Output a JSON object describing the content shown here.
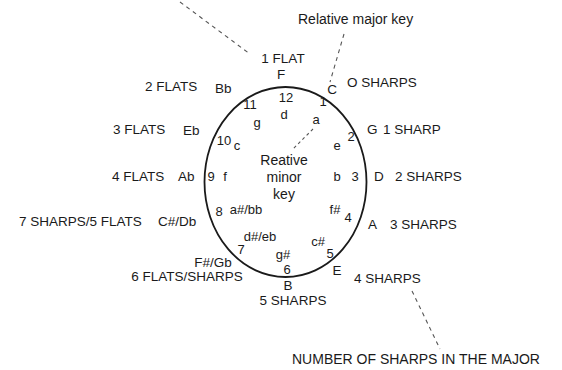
{
  "diagram": {
    "annotations": {
      "relative_major": "Relative major key",
      "relative_minor_line1": "Reative",
      "relative_minor_line2": "minor",
      "relative_minor_line3": "key",
      "number_of_sharps": "NUMBER OF SHARPS IN THE MAJOR"
    },
    "positions": [
      {
        "number": "12",
        "major": "F",
        "minor": "d",
        "signature": "1 FLAT"
      },
      {
        "number": "1",
        "major": "C",
        "minor": "a",
        "signature": "O SHARPS"
      },
      {
        "number": "2",
        "major": "G",
        "minor": "e",
        "signature": "1 SHARP"
      },
      {
        "number": "3",
        "major": "D",
        "minor": "b",
        "signature": "2 SHARPS"
      },
      {
        "number": "4",
        "major": "A",
        "minor": "f#",
        "signature": "3 SHARPS"
      },
      {
        "number": "5",
        "major": "E",
        "minor": "c#",
        "signature": "4 SHARPS"
      },
      {
        "number": "6",
        "major": "B",
        "minor": "g#",
        "signature": "5 SHARPS"
      },
      {
        "number": "7",
        "major": "F#/Gb",
        "minor": "d#/eb",
        "signature": "6 FLATS/SHARPS"
      },
      {
        "number": "8",
        "major": "C#/Db",
        "minor": "a#/bb",
        "signature": "7 SHARPS/5 FLATS"
      },
      {
        "number": "9",
        "major": "Ab",
        "minor": "f",
        "signature": "4 FLATS"
      },
      {
        "number": "10",
        "major": "Eb",
        "minor": "c",
        "signature": "3 FLATS"
      },
      {
        "number": "11",
        "major": "Bb",
        "minor": "g",
        "signature": "2 FLATS"
      }
    ],
    "colors": {
      "ink": "#1a1a1a",
      "dash": "#555555",
      "background": "#ffffff"
    }
  }
}
